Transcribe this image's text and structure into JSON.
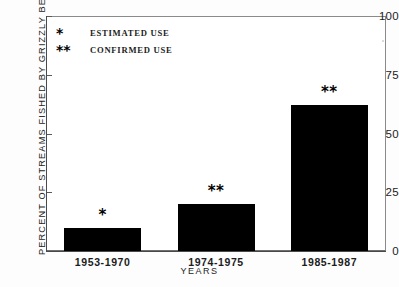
{
  "chart_data": {
    "type": "bar",
    "title": "",
    "subtitle": "",
    "categories": [
      "1953-1970",
      "1974-1975",
      "1985-1987"
    ],
    "values": [
      10,
      20,
      62
    ],
    "point_markers": [
      "*",
      "**",
      "**"
    ],
    "xlabel": "YEARS",
    "ylabel": "PERCENT OF STREAMS FISHED BY GRIZZLY BEARS",
    "ylim": [
      0,
      100
    ],
    "yticks": [
      0,
      25,
      50,
      75,
      100
    ],
    "ytick_labels": [
      "0",
      "25",
      "50",
      "75",
      "100"
    ],
    "grid": false,
    "legend_position": "upper-left",
    "legend": [
      {
        "symbol": "*",
        "label": "ESTIMATED USE"
      },
      {
        "symbol": "**",
        "label": "CONFIRMED USE"
      }
    ],
    "bar_color": "#000000",
    "background_color": "#ffffff",
    "axis_color": "#4a4a4a"
  }
}
